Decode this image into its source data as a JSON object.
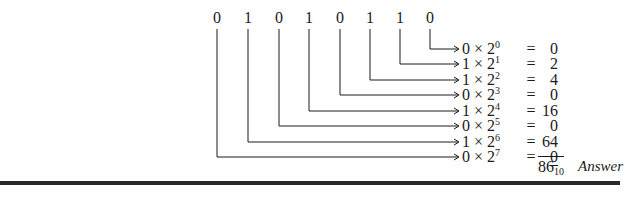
{
  "bits": [
    "0",
    "1",
    "0",
    "1",
    "0",
    "1",
    "1",
    "0"
  ],
  "bit_x": [
    217,
    248,
    279,
    309,
    340,
    370,
    400,
    430
  ],
  "rows": [
    {
      "bit": "0",
      "power": "0",
      "value": "0"
    },
    {
      "bit": "1",
      "power": "1",
      "value": "2"
    },
    {
      "bit": "1",
      "power": "2",
      "value": "4"
    },
    {
      "bit": "0",
      "power": "3",
      "value": "0"
    },
    {
      "bit": "1",
      "power": "4",
      "value": "16"
    },
    {
      "bit": "0",
      "power": "5",
      "value": "0"
    },
    {
      "bit": "1",
      "power": "6",
      "value": "64"
    },
    {
      "bit": "0",
      "power": "7",
      "value": "0"
    }
  ],
  "row_y": [
    41,
    56,
    72,
    87,
    103,
    118,
    134,
    149
  ],
  "times_symbol": "×",
  "base": "2",
  "equals": "=",
  "result": {
    "value": "86",
    "base": "10"
  },
  "answer_label": "Answer",
  "colors": {
    "ink": "#1a1a1a",
    "rule": "#2a2a2a"
  }
}
